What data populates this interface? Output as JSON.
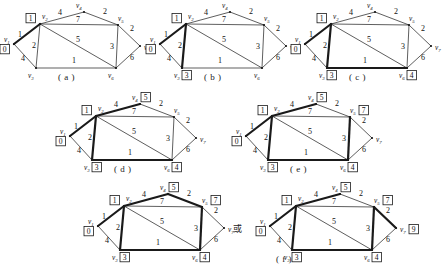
{
  "figure": {
    "vertex_names": [
      "v1",
      "v2",
      "v3",
      "v4",
      "v5",
      "v6",
      "v7"
    ],
    "vertex_subscripts": [
      "1",
      "2",
      "3",
      "4",
      "5",
      "6",
      "7"
    ],
    "vertex_base": "v",
    "edge_weights": {
      "v1_v2": "1",
      "v1_v3": "4",
      "v2_v3": "2",
      "v2_v4": "4",
      "v2_v5": "7",
      "v2_v6": "5",
      "v3_v6": "1",
      "v4_v5": "2",
      "v5_v6": "3",
      "v5_v7": "2",
      "v6_v7": "6"
    },
    "or_text": "或",
    "panels": [
      {
        "id": "a",
        "caption": "( a )",
        "labels": {
          "v1": "0",
          "v2": "1"
        },
        "bold_edges": [
          "v1_v2"
        ]
      },
      {
        "id": "b",
        "caption": "( b )",
        "labels": {
          "v1": "0",
          "v2": "1",
          "v3": "3"
        },
        "bold_edges": [
          "v1_v2",
          "v2_v3"
        ]
      },
      {
        "id": "c",
        "caption": "( c )",
        "labels": {
          "v1": "0",
          "v2": "1",
          "v3": "3",
          "v6": "4"
        },
        "bold_edges": [
          "v1_v2",
          "v2_v3",
          "v3_v6"
        ]
      },
      {
        "id": "d",
        "caption": "( d )",
        "labels": {
          "v1": "0",
          "v2": "1",
          "v3": "3",
          "v4": "5",
          "v6": "4"
        },
        "bold_edges": [
          "v1_v2",
          "v2_v3",
          "v3_v6",
          "v2_v4"
        ]
      },
      {
        "id": "e",
        "caption": "( e )",
        "labels": {
          "v1": "0",
          "v2": "1",
          "v3": "3",
          "v4": "5",
          "v5": "7",
          "v6": "4"
        },
        "bold_edges": [
          "v1_v2",
          "v2_v3",
          "v3_v6",
          "v2_v4",
          "v5_v6"
        ]
      },
      {
        "id": "f1",
        "caption": "",
        "labels": {
          "v1": "0",
          "v2": "1",
          "v3": "3",
          "v4": "5",
          "v5": "7",
          "v6": "4"
        },
        "bold_edges": [
          "v1_v2",
          "v2_v3",
          "v3_v6",
          "v2_v4",
          "v5_v6",
          "v4_v5"
        ]
      },
      {
        "id": "f2",
        "caption": "( f )",
        "labels": {
          "v1": "0",
          "v2": "1",
          "v3": "3",
          "v4": "5",
          "v5": "7",
          "v6": "4",
          "v7": "9"
        },
        "bold_edges": [
          "v1_v2",
          "v2_v3",
          "v3_v6",
          "v2_v4",
          "v5_v6",
          "v5_v7"
        ]
      }
    ]
  }
}
